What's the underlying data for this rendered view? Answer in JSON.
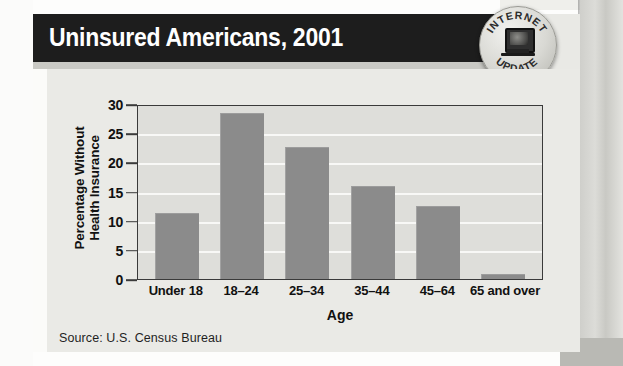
{
  "header": {
    "title": "Uninsured Americans, 2001"
  },
  "badge": {
    "name": "internet-update-badge",
    "top_text": "INTERNET",
    "bottom_text": "UPDATE",
    "icon": "computer-monitor-icon"
  },
  "source": {
    "text": "Source:  U.S. Census Bureau"
  },
  "colors": {
    "header_bg": "#1d1d1d",
    "header_text": "#ffffff",
    "card_bg": "#eaeae6",
    "plot_bg": "#dededa",
    "bar_fill": "#8b8b8b",
    "axis": "#3a3a3a",
    "gridline": "#f8f8f6"
  },
  "chart_data": {
    "type": "bar",
    "title": "Uninsured Americans, 2001",
    "categories": [
      "Under 18",
      "18–24",
      "25–34",
      "35–44",
      "45–64",
      "65 and over"
    ],
    "values": [
      11.3,
      28.5,
      22.7,
      16.0,
      12.5,
      0.9
    ],
    "xlabel": "Age",
    "ylabel": "Percentage Without Health Insurance",
    "ylabel_lines": [
      "Percentage Without",
      "Health Insurance"
    ],
    "ylim": [
      0,
      30
    ],
    "yticks": [
      0,
      5,
      10,
      15,
      20,
      25,
      30
    ],
    "ytick_labels": [
      "0",
      "5",
      "10",
      "15",
      "20",
      "25",
      "30"
    ],
    "grid": true,
    "legend": false,
    "source": "Source:  U.S. Census Bureau"
  }
}
